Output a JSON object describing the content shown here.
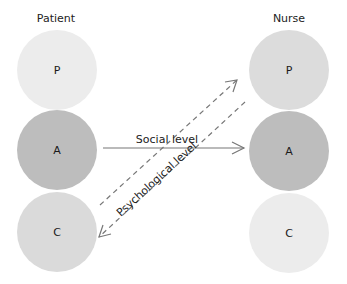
{
  "columns": {
    "left": {
      "title": "Patient"
    },
    "right": {
      "title": "Nurse"
    }
  },
  "states": {
    "left": [
      {
        "label": "P",
        "color": "#ececec"
      },
      {
        "label": "A",
        "color": "#bdbdbd"
      },
      {
        "label": "C",
        "color": "#dadada"
      }
    ],
    "right": [
      {
        "label": "P",
        "color": "#dcdcdc"
      },
      {
        "label": "A",
        "color": "#bdbdbd"
      },
      {
        "label": "C",
        "color": "#ececec"
      }
    ]
  },
  "transactions": {
    "social": {
      "label": "Social level",
      "from": "Patient A",
      "to": "Nurse A",
      "style": "solid"
    },
    "psychological": {
      "label": "Psychological level",
      "style": "dashed",
      "from_up": "Patient C",
      "to_up": "Nurse P",
      "from_down": "Nurse P",
      "to_down": "Patient C"
    }
  },
  "colors": {
    "line": "#777777"
  }
}
